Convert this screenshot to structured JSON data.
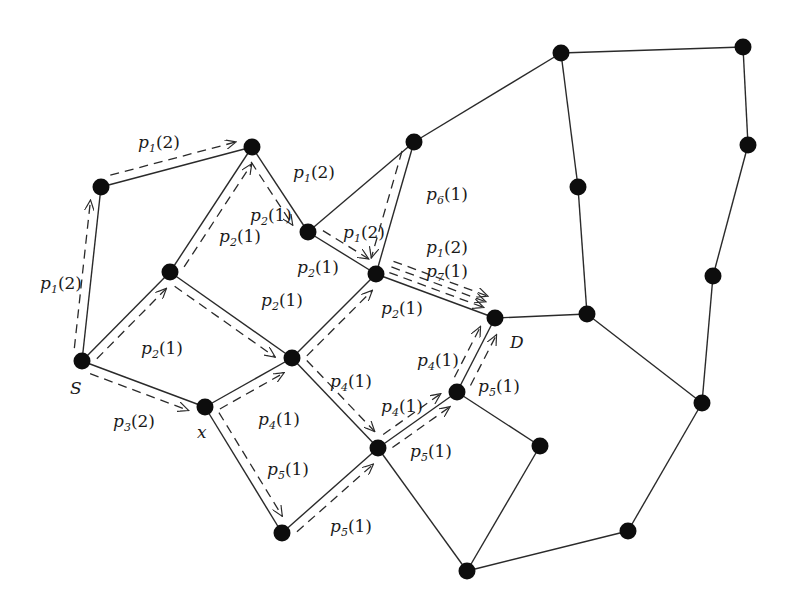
{
  "diagram": {
    "type": "network-flow-graph",
    "colors": {
      "background": "#ffffff",
      "edge": "#2a2a2a",
      "node": "#0d0d0d"
    },
    "node_labels": {
      "source": "S",
      "destination": "D",
      "intermediate": "x"
    },
    "nodes": [
      {
        "id": "S",
        "x": 82,
        "y": 361,
        "label": "S"
      },
      {
        "id": "A",
        "x": 101,
        "y": 187
      },
      {
        "id": "B",
        "x": 252,
        "y": 147
      },
      {
        "id": "C",
        "x": 170,
        "y": 272
      },
      {
        "id": "E",
        "x": 308,
        "y": 232
      },
      {
        "id": "F",
        "x": 414,
        "y": 142
      },
      {
        "id": "G",
        "x": 376,
        "y": 274
      },
      {
        "id": "H",
        "x": 292,
        "y": 358
      },
      {
        "id": "X",
        "x": 205,
        "y": 407,
        "label": "x"
      },
      {
        "id": "D",
        "x": 495,
        "y": 318,
        "label": "D"
      },
      {
        "id": "I",
        "x": 457,
        "y": 392
      },
      {
        "id": "J",
        "x": 378,
        "y": 448
      },
      {
        "id": "K",
        "x": 282,
        "y": 533
      },
      {
        "id": "L",
        "x": 540,
        "y": 446
      },
      {
        "id": "M",
        "x": 467,
        "y": 571
      },
      {
        "id": "N",
        "x": 628,
        "y": 531
      },
      {
        "id": "O",
        "x": 702,
        "y": 403
      },
      {
        "id": "P",
        "x": 713,
        "y": 276
      },
      {
        "id": "Q",
        "x": 748,
        "y": 145
      },
      {
        "id": "R",
        "x": 743,
        "y": 47
      },
      {
        "id": "T",
        "x": 561,
        "y": 53
      },
      {
        "id": "U",
        "x": 578,
        "y": 187
      },
      {
        "id": "V",
        "x": 587,
        "y": 314
      }
    ],
    "edges": [
      [
        "S",
        "A"
      ],
      [
        "A",
        "B"
      ],
      [
        "S",
        "C"
      ],
      [
        "C",
        "B"
      ],
      [
        "B",
        "E"
      ],
      [
        "C",
        "H"
      ],
      [
        "S",
        "X"
      ],
      [
        "X",
        "H"
      ],
      [
        "X",
        "K"
      ],
      [
        "E",
        "F"
      ],
      [
        "E",
        "G"
      ],
      [
        "F",
        "G"
      ],
      [
        "F",
        "T"
      ],
      [
        "G",
        "D"
      ],
      [
        "H",
        "G"
      ],
      [
        "H",
        "J"
      ],
      [
        "K",
        "J"
      ],
      [
        "J",
        "I"
      ],
      [
        "I",
        "D"
      ],
      [
        "I",
        "L"
      ],
      [
        "J",
        "M"
      ],
      [
        "L",
        "M"
      ],
      [
        "M",
        "N"
      ],
      [
        "N",
        "O"
      ],
      [
        "O",
        "P"
      ],
      [
        "P",
        "Q"
      ],
      [
        "Q",
        "R"
      ],
      [
        "R",
        "T"
      ],
      [
        "T",
        "U"
      ],
      [
        "U",
        "V"
      ],
      [
        "D",
        "V"
      ],
      [
        "V",
        "O"
      ]
    ],
    "flow_labels": [
      {
        "text_p": "p",
        "sub": "1",
        "arg": "(2)",
        "x": 138,
        "y": 148
      },
      {
        "text_p": "p",
        "sub": "1",
        "arg": "(2)",
        "x": 40,
        "y": 289
      },
      {
        "text_p": "p",
        "sub": "1",
        "arg": "(2)",
        "x": 293,
        "y": 178
      },
      {
        "text_p": "p",
        "sub": "2",
        "arg": "(1)",
        "x": 250,
        "y": 221
      },
      {
        "text_p": "p",
        "sub": "2",
        "arg": "(1)",
        "x": 219,
        "y": 242
      },
      {
        "text_p": "p",
        "sub": "1",
        "arg": "(2)",
        "x": 343,
        "y": 238
      },
      {
        "text_p": "p",
        "sub": "6",
        "arg": "(1)",
        "x": 426,
        "y": 200
      },
      {
        "text_p": "p",
        "sub": "2",
        "arg": "(1)",
        "x": 297,
        "y": 273
      },
      {
        "text_p": "p",
        "sub": "1",
        "arg": "(2)",
        "x": 426,
        "y": 253
      },
      {
        "text_p": "p",
        "sub": "7",
        "arg": "(1)",
        "x": 426,
        "y": 277
      },
      {
        "text_p": "p",
        "sub": "2",
        "arg": "(1)",
        "x": 261,
        "y": 306
      },
      {
        "text_p": "p",
        "sub": "2",
        "arg": "(1)",
        "x": 381,
        "y": 314
      },
      {
        "text_p": "p",
        "sub": "2",
        "arg": "(1)",
        "x": 141,
        "y": 354
      },
      {
        "text_p": "p",
        "sub": "3",
        "arg": "(2)",
        "x": 113,
        "y": 427
      },
      {
        "text_p": "p",
        "sub": "4",
        "arg": "(1)",
        "x": 330,
        "y": 387
      },
      {
        "text_p": "p",
        "sub": "4",
        "arg": "(1)",
        "x": 417,
        "y": 366
      },
      {
        "text_p": "p",
        "sub": "5",
        "arg": "(1)",
        "x": 478,
        "y": 392
      },
      {
        "text_p": "p",
        "sub": "4",
        "arg": "(1)",
        "x": 258,
        "y": 425
      },
      {
        "text_p": "p",
        "sub": "4",
        "arg": "(1)",
        "x": 381,
        "y": 412
      },
      {
        "text_p": "p",
        "sub": "5",
        "arg": "(1)",
        "x": 410,
        "y": 457
      },
      {
        "text_p": "p",
        "sub": "5",
        "arg": "(1)",
        "x": 267,
        "y": 475
      },
      {
        "text_p": "p",
        "sub": "5",
        "arg": "(1)",
        "x": 330,
        "y": 532
      }
    ]
  }
}
